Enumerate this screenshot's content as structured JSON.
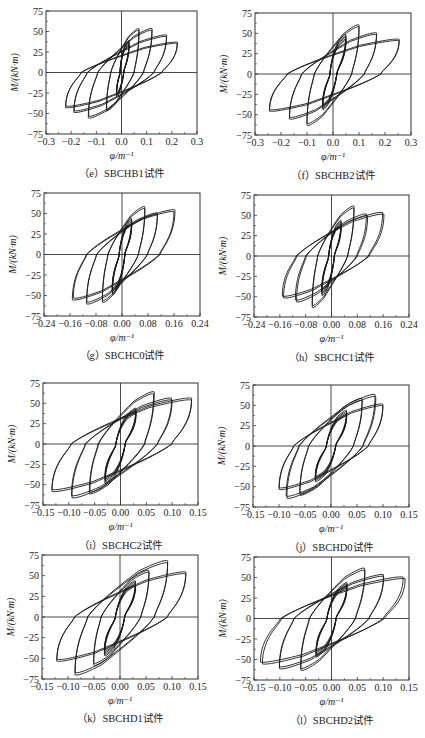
{
  "figure": {
    "ylabel": "M/(kN·m)",
    "xlabel": "φ/m⁻¹",
    "line_color": "#1a1a1a",
    "axis_color": "#333333"
  },
  "panels": [
    {
      "caption": "（e）SBCHB1试件",
      "xticks": [
        "−0.3",
        "−0.2",
        "−0.1",
        "0.0",
        "0.1",
        "0.2",
        "0.3"
      ],
      "xlim": [
        -0.3,
        0.3
      ]
    },
    {
      "caption": "（f）SBCHB2试件",
      "xticks": [
        "−0.3",
        "−0.2",
        "−0.1",
        "0.0",
        "0.1",
        "0.2",
        "0.3"
      ],
      "xlim": [
        -0.3,
        0.3
      ]
    },
    {
      "caption": "（g）SBCHC0试件",
      "xticks": [
        "−0.24",
        "−0.16",
        "−0.08",
        "0.00",
        "0.08",
        "0.16",
        "0.24"
      ],
      "xlim": [
        -0.24,
        0.24
      ]
    },
    {
      "caption": "（h）SBCHC1试件",
      "xticks": [
        "−0.24",
        "−0.16",
        "−0.08",
        "0.00",
        "0.08",
        "0.16",
        "0.24"
      ],
      "xlim": [
        -0.24,
        0.24
      ]
    },
    {
      "caption": "（i）SBCHC2试件",
      "xticks": [
        "−0.15",
        "−0.10",
        "−0.05",
        "0.00",
        "0.05",
        "0.10",
        "0.15"
      ],
      "xlim": [
        -0.15,
        0.15
      ]
    },
    {
      "caption": "（j）SBCHD0试件",
      "xticks": [
        "−0.15",
        "−0.10",
        "−0.05",
        "0.00",
        "0.05",
        "0.10",
        "0.15"
      ],
      "xlim": [
        -0.15,
        0.15
      ]
    },
    {
      "caption": "（k）SBCHD1试件",
      "xticks": [
        "−0.15",
        "−0.10",
        "−0.05",
        "0.00",
        "0.05",
        "0.10",
        "0.15"
      ],
      "xlim": [
        -0.15,
        0.15
      ]
    },
    {
      "caption": "（l）SBCHD2试件",
      "xticks": [
        "−0.15",
        "−0.10",
        "−0.05",
        "0.00",
        "0.05",
        "0.10",
        "0.15"
      ],
      "xlim": [
        -0.15,
        0.15
      ]
    }
  ],
  "yticks": [
    "75",
    "50",
    "25",
    "0",
    "−25",
    "−50",
    "−75"
  ],
  "chart_data": [
    {
      "type": "line",
      "title": "(e) SBCHB1试件",
      "xlabel": "φ/m⁻¹",
      "ylabel": "M/(kN·m)",
      "xlim": [
        -0.3,
        0.3
      ],
      "ylim": [
        -75,
        75
      ],
      "grid": false,
      "description": "Hysteresis loops (moment-curvature)",
      "loops": [
        {
          "phi_max": 0.03,
          "M_max": 40,
          "phi_min": -0.02,
          "M_min": -30
        },
        {
          "phi_max": 0.07,
          "M_max": 55,
          "phi_min": -0.06,
          "M_min": -48
        },
        {
          "phi_max": 0.12,
          "M_max": 55,
          "phi_min": -0.13,
          "M_min": -57
        },
        {
          "phi_max": 0.18,
          "M_max": 47,
          "phi_min": -0.19,
          "M_min": -50
        },
        {
          "phi_max": 0.22,
          "M_max": 38,
          "phi_min": -0.22,
          "M_min": -44
        }
      ]
    },
    {
      "type": "line",
      "title": "(f) SBCHB2试件",
      "xlabel": "φ/m⁻¹",
      "ylabel": "M/(kN·m)",
      "xlim": [
        -0.3,
        0.3
      ],
      "ylim": [
        -75,
        75
      ],
      "grid": false,
      "loops": [
        {
          "phi_max": 0.05,
          "M_max": 50,
          "phi_min": -0.04,
          "M_min": -45
        },
        {
          "phi_max": 0.1,
          "M_max": 62,
          "phi_min": -0.1,
          "M_min": -65
        },
        {
          "phi_max": 0.17,
          "M_max": 52,
          "phi_min": -0.17,
          "M_min": -57
        },
        {
          "phi_max": 0.25,
          "M_max": 44,
          "phi_min": -0.24,
          "M_min": -47
        }
      ]
    },
    {
      "type": "line",
      "title": "(g) SBCHC0试件",
      "xlabel": "φ/m⁻¹",
      "ylabel": "M/(kN·m)",
      "xlim": [
        -0.24,
        0.24
      ],
      "ylim": [
        -75,
        75
      ],
      "grid": false,
      "loops": [
        {
          "phi_max": 0.03,
          "M_max": 45,
          "phi_min": -0.03,
          "M_min": -50
        },
        {
          "phi_max": 0.07,
          "M_max": 60,
          "phi_min": -0.06,
          "M_min": -60
        },
        {
          "phi_max": 0.11,
          "M_max": 52,
          "phi_min": -0.11,
          "M_min": -62
        },
        {
          "phi_max": 0.16,
          "M_max": 56,
          "phi_min": -0.15,
          "M_min": -57
        }
      ]
    },
    {
      "type": "line",
      "title": "(h) SBCHC1试件",
      "xlabel": "φ/m⁻¹",
      "ylabel": "M/(kN·m)",
      "xlim": [
        -0.24,
        0.24
      ],
      "ylim": [
        -75,
        75
      ],
      "grid": false,
      "loops": [
        {
          "phi_max": 0.03,
          "M_max": 45,
          "phi_min": -0.03,
          "M_min": -50
        },
        {
          "phi_max": 0.07,
          "M_max": 63,
          "phi_min": -0.06,
          "M_min": -65
        },
        {
          "phi_max": 0.11,
          "M_max": 53,
          "phi_min": -0.11,
          "M_min": -58
        },
        {
          "phi_max": 0.16,
          "M_max": 55,
          "phi_min": -0.15,
          "M_min": -53
        }
      ]
    },
    {
      "type": "line",
      "title": "(i) SBCHC2试件",
      "xlabel": "φ/m⁻¹",
      "ylabel": "M/(kN·m)",
      "xlim": [
        -0.15,
        0.15
      ],
      "ylim": [
        -75,
        75
      ],
      "grid": false,
      "loops": [
        {
          "phi_max": 0.03,
          "M_max": 45,
          "phi_min": -0.03,
          "M_min": -50
        },
        {
          "phi_max": 0.065,
          "M_max": 66,
          "phi_min": -0.06,
          "M_min": -63
        },
        {
          "phi_max": 0.1,
          "M_max": 58,
          "phi_min": -0.095,
          "M_min": -68
        },
        {
          "phi_max": 0.14,
          "M_max": 58,
          "phi_min": -0.135,
          "M_min": -60
        }
      ]
    },
    {
      "type": "line",
      "title": "(j) SBCHD0试件",
      "xlabel": "φ/m⁻¹",
      "ylabel": "M/(kN·m)",
      "xlim": [
        -0.15,
        0.15
      ],
      "ylim": [
        -75,
        75
      ],
      "grid": false,
      "loops": [
        {
          "phi_max": 0.03,
          "M_max": 45,
          "phi_min": -0.03,
          "M_min": -45
        },
        {
          "phi_max": 0.06,
          "M_max": 60,
          "phi_min": -0.06,
          "M_min": -62
        },
        {
          "phi_max": 0.085,
          "M_max": 65,
          "phi_min": -0.085,
          "M_min": -66
        },
        {
          "phi_max": 0.1,
          "M_max": 53,
          "phi_min": -0.1,
          "M_min": -55
        }
      ]
    },
    {
      "type": "line",
      "title": "(k) SBCHD1试件",
      "xlabel": "φ/m⁻¹",
      "ylabel": "M/(kN·m)",
      "xlim": [
        -0.15,
        0.15
      ],
      "ylim": [
        -75,
        75
      ],
      "grid": false,
      "loops": [
        {
          "phi_max": 0.03,
          "M_max": 45,
          "phi_min": -0.03,
          "M_min": -48
        },
        {
          "phi_max": 0.055,
          "M_max": 58,
          "phi_min": -0.05,
          "M_min": -60
        },
        {
          "phi_max": 0.09,
          "M_max": 70,
          "phi_min": -0.085,
          "M_min": -72
        },
        {
          "phi_max": 0.125,
          "M_max": 56,
          "phi_min": -0.12,
          "M_min": -55
        }
      ]
    },
    {
      "type": "line",
      "title": "(l) SBCHD2试件",
      "xlabel": "φ/m⁻¹",
      "ylabel": "M/(kN·m)",
      "xlim": [
        -0.15,
        0.15
      ],
      "ylim": [
        -75,
        75
      ],
      "grid": false,
      "loops": [
        {
          "phi_max": 0.03,
          "M_max": 45,
          "phi_min": -0.03,
          "M_min": -48
        },
        {
          "phi_max": 0.065,
          "M_max": 63,
          "phi_min": -0.06,
          "M_min": -65
        },
        {
          "phi_max": 0.1,
          "M_max": 55,
          "phi_min": -0.1,
          "M_min": -63
        },
        {
          "phi_max": 0.14,
          "M_max": 52,
          "phi_min": -0.135,
          "M_min": -57
        }
      ]
    }
  ]
}
